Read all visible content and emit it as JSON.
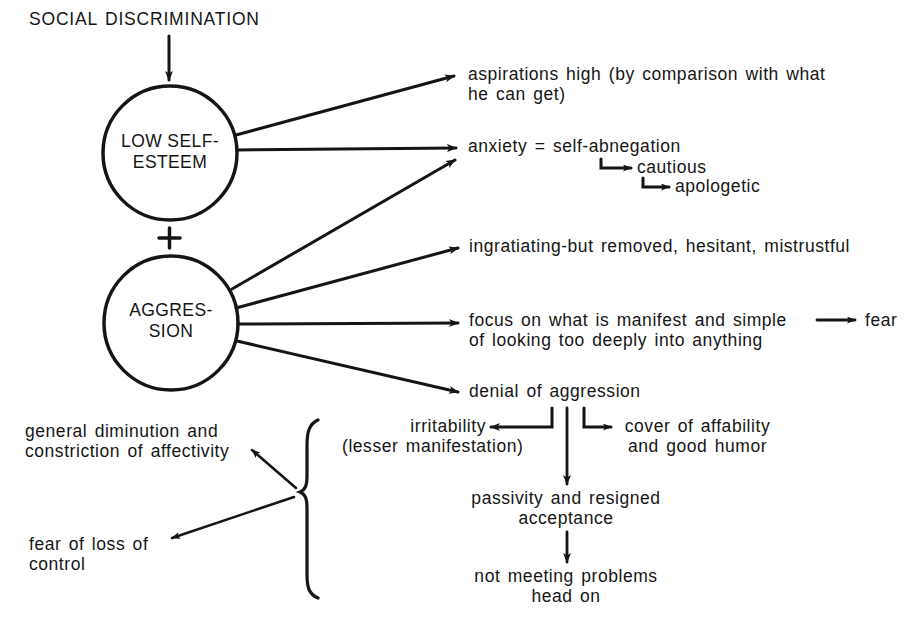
{
  "diagram": {
    "root": "SOCIAL DISCRIMINATION",
    "nodes": {
      "low_self_esteem": {
        "line1": "LOW SELF-",
        "line2": "ESTEEM"
      },
      "combine_symbol": "+",
      "aggression": {
        "line1": "AGGRES-",
        "line2": "SION"
      }
    },
    "outcomes": {
      "aspirations": {
        "line1": "aspirations high (by comparison with what",
        "line2": "he can get)"
      },
      "anxiety": {
        "line1": "anxiety = self-abnegation"
      },
      "cautious": "cautious",
      "apologetic": "apologetic",
      "ingratiating": {
        "line1": "ingratiating-but removed, hesitant, mistrustful"
      },
      "focus": {
        "line1": "focus on what is manifest and simple",
        "line2": "of looking too deeply into anything"
      },
      "fear": "fear",
      "denial": "denial of aggression",
      "irritability": {
        "line1": "irritability",
        "line2": "(lesser manifestation)"
      },
      "cover": {
        "line1": "cover of affability",
        "line2": "and good humor"
      },
      "passivity": {
        "line1": "passivity and resigned",
        "line2": "acceptance"
      },
      "not_meeting": {
        "line1": "not meeting problems",
        "line2": "head on"
      },
      "diminution": {
        "line1": "general diminution and",
        "line2": "constriction of affectivity"
      },
      "fear_loss": {
        "line1": "fear of loss of",
        "line2": "control"
      }
    },
    "colors": {
      "ink": "#151515",
      "background": "#ffffff"
    }
  }
}
